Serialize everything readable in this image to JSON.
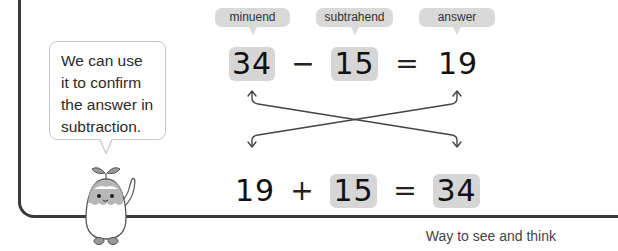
{
  "speech_bubble": {
    "lines": [
      "We can use",
      "it to confirm",
      "the answer in",
      "subtraction."
    ]
  },
  "labels": {
    "minuend": "minuend",
    "subtrahend": "subtrahend",
    "answer": "answer"
  },
  "subtraction": {
    "minuend": "34",
    "operator": "−",
    "subtrahend": "15",
    "equals": "=",
    "answer": "19"
  },
  "addition": {
    "addend1": "19",
    "operator": "+",
    "addend2": "15",
    "equals": "=",
    "sum": "34"
  },
  "footer": {
    "caption": "Way to see and think"
  },
  "colors": {
    "highlight_box": "#d6d6d6",
    "label_bg": "#d9d9d9",
    "frame": "#3a3a3a"
  }
}
